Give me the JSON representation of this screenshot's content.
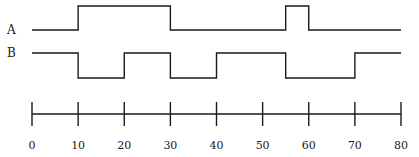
{
  "diagram": {
    "type": "timing-diagram",
    "signals": [
      {
        "name": "A",
        "initial": 0,
        "transitions": [
          10,
          30,
          55,
          60
        ],
        "segments": [
          {
            "from": 0,
            "to": 10,
            "level": "low"
          },
          {
            "from": 10,
            "to": 30,
            "level": "high"
          },
          {
            "from": 30,
            "to": 55,
            "level": "low"
          },
          {
            "from": 55,
            "to": 60,
            "level": "high"
          },
          {
            "from": 60,
            "to": 80,
            "level": "low"
          }
        ]
      },
      {
        "name": "B",
        "initial": 1,
        "transitions": [
          10,
          20,
          30,
          40,
          55,
          70
        ],
        "segments": [
          {
            "from": 0,
            "to": 10,
            "level": "high"
          },
          {
            "from": 10,
            "to": 20,
            "level": "low"
          },
          {
            "from": 20,
            "to": 30,
            "level": "high"
          },
          {
            "from": 30,
            "to": 40,
            "level": "low"
          },
          {
            "from": 40,
            "to": 55,
            "level": "high"
          },
          {
            "from": 55,
            "to": 70,
            "level": "low"
          },
          {
            "from": 70,
            "to": 80,
            "level": "high"
          }
        ]
      }
    ],
    "time_axis": {
      "min": 0,
      "max": 80,
      "ticks": [
        0,
        10,
        20,
        30,
        40,
        50,
        60,
        70,
        80
      ],
      "tick_labels": [
        "0",
        "10",
        "20",
        "30",
        "40",
        "50",
        "60",
        "70",
        "80"
      ]
    },
    "colors": {
      "line": "#1a1a1a",
      "background": "#ffffff"
    }
  }
}
